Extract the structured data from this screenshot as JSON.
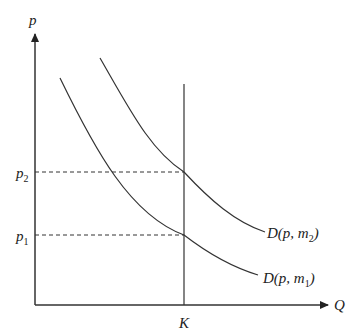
{
  "axes": {
    "y_label": "p",
    "x_label": "Q"
  },
  "price_levels": [
    {
      "label": "p",
      "sub": "2"
    },
    {
      "label": "p",
      "sub": "1"
    }
  ],
  "capacity": {
    "label": "K"
  },
  "curves": [
    {
      "label_pre": "D(p, m",
      "sub": "2",
      "label_post": ")"
    },
    {
      "label_pre": "D(p, m",
      "sub": "1",
      "label_post": ")"
    }
  ],
  "colors": {
    "line": "#333333"
  }
}
